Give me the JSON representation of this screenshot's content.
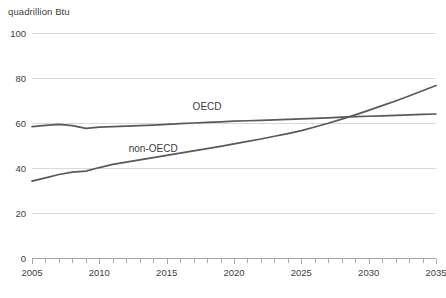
{
  "chart_data": {
    "type": "line",
    "title": "",
    "subtitle": "",
    "unit_label": "quadrillion Btu",
    "xlabel": "",
    "ylabel": "quadrillion Btu",
    "xlim": [
      2005,
      2035
    ],
    "ylim": [
      0,
      100
    ],
    "grid": true,
    "legend_position": "inline-annotation",
    "y_ticks": [
      0,
      20,
      40,
      60,
      80,
      100
    ],
    "y_tick_labels": [
      "0",
      "20",
      "40",
      "60",
      "80",
      "100"
    ],
    "x_ticks": [
      2005,
      2010,
      2015,
      2020,
      2025,
      2030,
      2035
    ],
    "x_tick_labels": [
      "2005",
      "2010",
      "2015",
      "2020",
      "2025",
      "2030",
      "2035"
    ],
    "x_minor_tick_interval": 1,
    "x": [
      2005,
      2006,
      2007,
      2008,
      2009,
      2010,
      2011,
      2012,
      2013,
      2014,
      2015,
      2016,
      2017,
      2018,
      2019,
      2020,
      2021,
      2022,
      2023,
      2024,
      2025,
      2026,
      2027,
      2028,
      2029,
      2030,
      2031,
      2032,
      2033,
      2034,
      2035
    ],
    "series": [
      {
        "name": "OECD",
        "color": "#595959",
        "label_x": 2018,
        "label_y": 66,
        "values": [
          58.4,
          58.9,
          59.4,
          58.8,
          57.6,
          58.2,
          58.4,
          58.6,
          58.8,
          59.1,
          59.4,
          59.7,
          60.0,
          60.3,
          60.5,
          60.8,
          61.0,
          61.2,
          61.4,
          61.6,
          61.8,
          62.1,
          62.3,
          62.6,
          62.8,
          63.0,
          63.2,
          63.4,
          63.6,
          63.8,
          64.0
        ]
      },
      {
        "name": "non-OECD",
        "color": "#595959",
        "label_x": 2014,
        "label_y": 47,
        "values": [
          34.2,
          35.6,
          37.1,
          38.2,
          38.6,
          40.2,
          41.6,
          42.6,
          43.6,
          44.6,
          45.6,
          46.6,
          47.6,
          48.6,
          49.6,
          50.7,
          51.8,
          52.9,
          54.1,
          55.3,
          56.6,
          58.2,
          59.9,
          61.7,
          63.6,
          65.6,
          67.7,
          69.8,
          72.0,
          74.3,
          76.7
        ]
      }
    ]
  },
  "plot_geometry": {
    "left": 32,
    "right": 436,
    "top": 33,
    "bottom": 258
  }
}
